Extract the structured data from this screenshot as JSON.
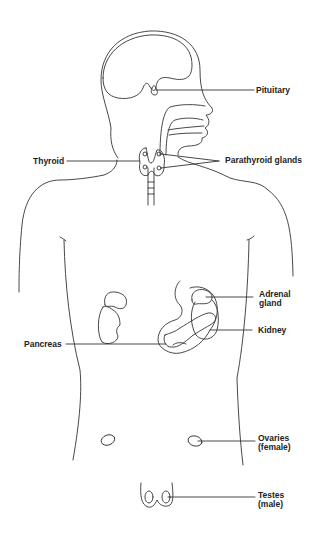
{
  "diagram": {
    "type": "anatomical-illustration",
    "line_color": "#333333",
    "background": "#ffffff"
  },
  "labels": {
    "pituitary": "Pituitary",
    "thyroid": "Thyroid",
    "parathyroid": "Parathyroid glands",
    "adrenal_line1": "Adrenal",
    "adrenal_line2": "gland",
    "kidney": "Kidney",
    "pancreas": "Pancreas",
    "ovaries_line1": "Ovaries",
    "ovaries_line2": "(female)",
    "testes_line1": "Testes",
    "testes_line2": "(male)"
  }
}
